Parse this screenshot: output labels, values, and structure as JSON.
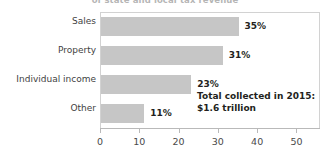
{
  "chart_data": {
    "type": "bar",
    "orientation": "horizontal",
    "title": "of state and local tax revenue",
    "categories": [
      "Sales",
      "Property",
      "Individual income",
      "Other"
    ],
    "values": [
      35,
      31,
      23,
      11
    ],
    "value_labels": [
      "35%",
      "31%",
      "23%",
      "11%"
    ],
    "xlabel": "",
    "ylabel": "",
    "xlim": [
      0,
      56
    ],
    "xticks": [
      0,
      10,
      20,
      30,
      40,
      50
    ],
    "xtick_labels": [
      "0",
      "10",
      "20",
      "30",
      "40",
      "50"
    ],
    "grid": false,
    "legend": null,
    "annotation": {
      "line1": "Total collected in 2015:",
      "line2": "$1.6 trillion"
    },
    "colors": {
      "bar": "#c6c6c6",
      "text": "#231f20",
      "axis": "#b9b9b9",
      "frame": "#d2d2d2",
      "background": "#ffffff"
    }
  }
}
